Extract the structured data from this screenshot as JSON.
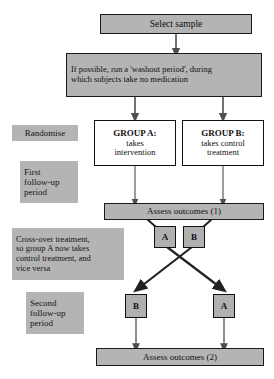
{
  "diagram": {
    "colors": {
      "box_fill_gray": "#b4b4b4",
      "box_fill_white": "#ffffff",
      "border": "#111111",
      "connector": "#5a5a5a",
      "crossover_line": "#2b2b2b",
      "text": "#111111"
    },
    "nodes": {
      "select_sample": {
        "label": "Select sample"
      },
      "washout": {
        "line1": "If possible, run a 'washout period', during",
        "line2": "which subjects take no medication"
      },
      "group_a": {
        "heading": "GROUP A:",
        "line1": "takes",
        "line2": "intervention"
      },
      "group_b": {
        "heading": "GROUP B:",
        "line1": "takes control",
        "line2": "treatment"
      },
      "assess_1": {
        "label": "Assess outcomes (1)"
      },
      "assess_2": {
        "label": "Assess outcomes (2)"
      },
      "crossover_top_left": {
        "label": "A"
      },
      "crossover_top_right": {
        "label": "B"
      },
      "crossover_bottom_left": {
        "label": "B"
      },
      "crossover_bottom_right": {
        "label": "A"
      }
    },
    "side_labels": {
      "randomise": {
        "label": "Randomise"
      },
      "first_followup": {
        "line1": "First",
        "line2": "follow-up",
        "line3": "period"
      },
      "crossover_note": {
        "line1": "Cross-over treatment,",
        "line2": "so group A now takes",
        "line3": "control treatment, and",
        "line4": "vice versa"
      },
      "second_followup": {
        "line1": "Second",
        "line2": "follow-up",
        "line3": "period"
      }
    }
  }
}
